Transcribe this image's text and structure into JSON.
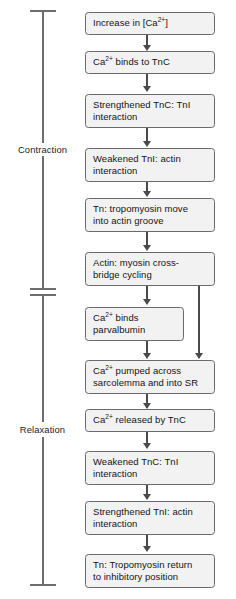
{
  "diagram": {
    "type": "flowchart",
    "orientation": "vertical",
    "colors": {
      "box_fill": "#f2f2f2",
      "box_border": "#6a6a6a",
      "connector": "#4a4a4a",
      "bracket": "#6d6d6d",
      "text": "#141414",
      "background": "#ffffff"
    },
    "phases": [
      {
        "id": "contraction",
        "label": "Contraction",
        "covers_steps": [
          1,
          2,
          3,
          4,
          5,
          6
        ]
      },
      {
        "id": "relaxation",
        "label": "Relaxation",
        "covers_steps": [
          7,
          8,
          9,
          10,
          11,
          12
        ]
      }
    ],
    "steps": [
      {
        "id": "step-1",
        "line1": "Increase in [Ca",
        "sup": "2+",
        "line1_tail": "]",
        "line2": ""
      },
      {
        "id": "step-2",
        "line1": "Ca",
        "sup": "2+",
        "line1_tail": " binds to TnC",
        "line2": ""
      },
      {
        "id": "step-3",
        "line1": "Strengthened TnC: TnI",
        "sup": "",
        "line1_tail": "",
        "line2": "interaction"
      },
      {
        "id": "step-4",
        "line1": "Weakened TnI: actin",
        "sup": "",
        "line1_tail": "",
        "line2": "interaction"
      },
      {
        "id": "step-5",
        "line1": "Tn: tropomyosin move",
        "sup": "",
        "line1_tail": "",
        "line2": "into actin groove"
      },
      {
        "id": "step-6",
        "line1": "Actin: myosin cross-",
        "sup": "",
        "line1_tail": "",
        "line2": "bridge cycling"
      },
      {
        "id": "step-7",
        "line1": "Ca",
        "sup": "2+",
        "line1_tail": " binds",
        "line2": "parvalbumin"
      },
      {
        "id": "step-8",
        "line1": "Ca",
        "sup": "2+",
        "line1_tail": " pumped across",
        "line2": "sarcolemma and into SR"
      },
      {
        "id": "step-9",
        "line1": "Ca",
        "sup": "2+",
        "line1_tail": " released by TnC",
        "line2": ""
      },
      {
        "id": "step-10",
        "line1": "Weakened TnC: TnI",
        "sup": "",
        "line1_tail": "",
        "line2": "interaction"
      },
      {
        "id": "step-11",
        "line1": "Strengthened TnI: actin",
        "sup": "",
        "line1_tail": "",
        "line2": "interaction"
      },
      {
        "id": "step-12",
        "line1": "Tn: Tropomyosin return",
        "sup": "",
        "line1_tail": "",
        "line2": "to inhibitory position"
      }
    ],
    "edges": [
      {
        "from": "step-1",
        "to": "step-2",
        "kind": "main"
      },
      {
        "from": "step-2",
        "to": "step-3",
        "kind": "main"
      },
      {
        "from": "step-3",
        "to": "step-4",
        "kind": "main"
      },
      {
        "from": "step-4",
        "to": "step-5",
        "kind": "main"
      },
      {
        "from": "step-5",
        "to": "step-6",
        "kind": "main"
      },
      {
        "from": "step-6",
        "to": "step-7",
        "kind": "main"
      },
      {
        "from": "step-6",
        "to": "step-8",
        "kind": "bypass"
      },
      {
        "from": "step-7",
        "to": "step-8",
        "kind": "main"
      },
      {
        "from": "step-8",
        "to": "step-9",
        "kind": "main"
      },
      {
        "from": "step-9",
        "to": "step-10",
        "kind": "main"
      },
      {
        "from": "step-10",
        "to": "step-11",
        "kind": "main"
      },
      {
        "from": "step-11",
        "to": "step-12",
        "kind": "main"
      }
    ]
  }
}
